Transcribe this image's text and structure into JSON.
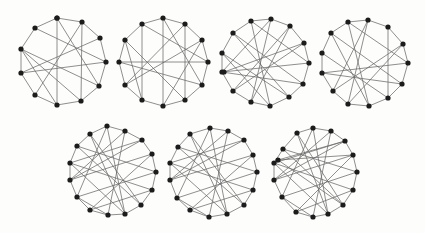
{
  "figure": {
    "graph_color": "#1c1c1c",
    "edge_color": "#6a6a6a",
    "graphs": [
      {
        "id": "g1",
        "nodes": [
          [
            57,
            18
          ],
          [
            82,
            22
          ],
          [
            35,
            28
          ],
          [
            100,
            38
          ],
          [
            21,
            49
          ],
          [
            106,
            62
          ],
          [
            21,
            73
          ],
          [
            99,
            86
          ],
          [
            35,
            95
          ],
          [
            57,
            105
          ],
          [
            81,
            101
          ],
          [
            57,
            18
          ]
        ],
        "edges": [
          [
            0,
            1
          ],
          [
            0,
            2
          ],
          [
            1,
            3
          ],
          [
            3,
            5
          ],
          [
            5,
            7
          ],
          [
            7,
            10
          ],
          [
            10,
            9
          ],
          [
            9,
            8
          ],
          [
            8,
            6
          ],
          [
            6,
            4
          ],
          [
            4,
            2
          ],
          [
            0,
            9
          ],
          [
            2,
            5
          ],
          [
            4,
            7
          ],
          [
            4,
            10
          ],
          [
            6,
            5
          ],
          [
            1,
            8
          ],
          [
            3,
            6
          ],
          [
            0,
            7
          ],
          [
            4,
            9
          ],
          [
            1,
            10
          ]
        ]
      },
      {
        "id": "g2",
        "nodes": [
          [
            163,
            18
          ],
          [
            142,
            24
          ],
          [
            185,
            24
          ],
          [
            125,
            40
          ],
          [
            202,
            40
          ],
          [
            119,
            62
          ],
          [
            208,
            62
          ],
          [
            125,
            85
          ],
          [
            202,
            85
          ],
          [
            142,
            100
          ],
          [
            185,
            100
          ],
          [
            163,
            106
          ]
        ],
        "edges": [
          [
            0,
            1
          ],
          [
            0,
            2
          ],
          [
            1,
            3
          ],
          [
            2,
            4
          ],
          [
            3,
            5
          ],
          [
            4,
            6
          ],
          [
            5,
            7
          ],
          [
            6,
            8
          ],
          [
            7,
            9
          ],
          [
            8,
            10
          ],
          [
            9,
            11
          ],
          [
            10,
            11
          ],
          [
            0,
            11
          ],
          [
            1,
            9
          ],
          [
            2,
            10
          ],
          [
            1,
            6
          ],
          [
            3,
            10
          ],
          [
            5,
            8
          ],
          [
            2,
            7
          ],
          [
            4,
            11
          ],
          [
            3,
            9
          ],
          [
            5,
            6
          ],
          [
            0,
            8
          ],
          [
            7,
            4
          ]
        ]
      },
      {
        "id": "g3",
        "nodes": [
          [
            251,
            21
          ],
          [
            271,
            19
          ],
          [
            290,
            26
          ],
          [
            233,
            33
          ],
          [
            304,
            43
          ],
          [
            222,
            53
          ],
          [
            309,
            63
          ],
          [
            222,
            72
          ],
          [
            303,
            84
          ],
          [
            233,
            91
          ],
          [
            289,
            97
          ],
          [
            251,
            102
          ],
          [
            270,
            106
          ],
          [
            224,
            72
          ]
        ],
        "edges": [
          [
            0,
            1
          ],
          [
            1,
            2
          ],
          [
            0,
            3
          ],
          [
            2,
            4
          ],
          [
            3,
            5
          ],
          [
            4,
            6
          ],
          [
            5,
            7
          ],
          [
            6,
            8
          ],
          [
            7,
            9
          ],
          [
            8,
            10
          ],
          [
            9,
            11
          ],
          [
            10,
            12
          ],
          [
            11,
            12
          ],
          [
            0,
            6
          ],
          [
            1,
            11
          ],
          [
            2,
            9
          ],
          [
            3,
            8
          ],
          [
            5,
            10
          ],
          [
            7,
            6
          ],
          [
            7,
            8
          ],
          [
            4,
            9
          ],
          [
            0,
            12
          ],
          [
            1,
            7
          ],
          [
            2,
            11
          ],
          [
            3,
            10
          ],
          [
            5,
            12
          ],
          [
            4,
            13
          ]
        ]
      },
      {
        "id": "g4",
        "nodes": [
          [
            348,
            22
          ],
          [
            368,
            20
          ],
          [
            388,
            27
          ],
          [
            331,
            33
          ],
          [
            403,
            44
          ],
          [
            322,
            53
          ],
          [
            408,
            63
          ],
          [
            322,
            73
          ],
          [
            402,
            84
          ],
          [
            333,
            91
          ],
          [
            388,
            98
          ],
          [
            369,
            106
          ],
          [
            348,
            104
          ]
        ],
        "edges": [
          [
            0,
            1
          ],
          [
            1,
            2
          ],
          [
            0,
            3
          ],
          [
            2,
            4
          ],
          [
            3,
            5
          ],
          [
            4,
            6
          ],
          [
            5,
            7
          ],
          [
            6,
            8
          ],
          [
            7,
            9
          ],
          [
            8,
            10
          ],
          [
            9,
            12
          ],
          [
            10,
            11
          ],
          [
            11,
            12
          ],
          [
            0,
            11
          ],
          [
            2,
            10
          ],
          [
            1,
            9
          ],
          [
            3,
            8
          ],
          [
            5,
            10
          ],
          [
            7,
            6
          ],
          [
            7,
            8
          ],
          [
            4,
            9
          ],
          [
            0,
            6
          ],
          [
            1,
            12
          ],
          [
            4,
            12
          ],
          [
            3,
            11
          ]
        ]
      },
      {
        "id": "g5",
        "nodes": [
          [
            107,
            126
          ],
          [
            125,
            131
          ],
          [
            90,
            134
          ],
          [
            142,
            140
          ],
          [
            77,
            146
          ],
          [
            152,
            154
          ],
          [
            70,
            163
          ],
          [
            156,
            172
          ],
          [
            70,
            180
          ],
          [
            152,
            190
          ],
          [
            77,
            197
          ],
          [
            141,
            205
          ],
          [
            90,
            210
          ],
          [
            125,
            214
          ],
          [
            108,
            215
          ]
        ],
        "edges": [
          [
            0,
            1
          ],
          [
            0,
            2
          ],
          [
            1,
            3
          ],
          [
            2,
            4
          ],
          [
            3,
            5
          ],
          [
            4,
            6
          ],
          [
            5,
            7
          ],
          [
            6,
            8
          ],
          [
            7,
            9
          ],
          [
            8,
            10
          ],
          [
            9,
            11
          ],
          [
            10,
            12
          ],
          [
            11,
            13
          ],
          [
            12,
            14
          ],
          [
            13,
            14
          ],
          [
            0,
            10
          ],
          [
            1,
            8
          ],
          [
            2,
            13
          ],
          [
            3,
            6
          ],
          [
            4,
            11
          ],
          [
            5,
            12
          ],
          [
            6,
            9
          ],
          [
            7,
            10
          ],
          [
            8,
            5
          ],
          [
            9,
            12
          ],
          [
            1,
            14
          ],
          [
            2,
            11
          ],
          [
            3,
            8
          ],
          [
            0,
            13
          ],
          [
            4,
            7
          ],
          [
            6,
            13
          ],
          [
            10,
            14
          ]
        ]
      },
      {
        "id": "g6",
        "nodes": [
          [
            210,
            128
          ],
          [
            228,
            131
          ],
          [
            190,
            134
          ],
          [
            244,
            140
          ],
          [
            178,
            147
          ],
          [
            253,
            155
          ],
          [
            170,
            163
          ],
          [
            257,
            172
          ],
          [
            170,
            180
          ],
          [
            253,
            190
          ],
          [
            177,
            198
          ],
          [
            244,
            205
          ],
          [
            190,
            210
          ],
          [
            227,
            214
          ],
          [
            209,
            217
          ]
        ],
        "edges": [
          [
            0,
            1
          ],
          [
            0,
            2
          ],
          [
            1,
            3
          ],
          [
            2,
            4
          ],
          [
            3,
            5
          ],
          [
            4,
            6
          ],
          [
            5,
            7
          ],
          [
            6,
            8
          ],
          [
            7,
            9
          ],
          [
            8,
            10
          ],
          [
            9,
            11
          ],
          [
            10,
            12
          ],
          [
            11,
            13
          ],
          [
            12,
            14
          ],
          [
            13,
            14
          ],
          [
            0,
            10
          ],
          [
            1,
            8
          ],
          [
            2,
            13
          ],
          [
            3,
            6
          ],
          [
            4,
            11
          ],
          [
            5,
            12
          ],
          [
            6,
            9
          ],
          [
            7,
            10
          ],
          [
            8,
            5
          ],
          [
            9,
            12
          ],
          [
            1,
            14
          ],
          [
            2,
            11
          ],
          [
            3,
            8
          ],
          [
            0,
            13
          ],
          [
            4,
            7
          ],
          [
            6,
            13
          ],
          [
            10,
            14
          ]
        ]
      },
      {
        "id": "g7",
        "nodes": [
          [
            313,
            128
          ],
          [
            331,
            131
          ],
          [
            297,
            133
          ],
          [
            345,
            141
          ],
          [
            283,
            149
          ],
          [
            353,
            155
          ],
          [
            274,
            163
          ],
          [
            357,
            172
          ],
          [
            274,
            180
          ],
          [
            353,
            190
          ],
          [
            282,
            197
          ],
          [
            343,
            205
          ],
          [
            296,
            212
          ],
          [
            328,
            214
          ],
          [
            313,
            217
          ],
          [
            278,
            160
          ]
        ],
        "edges": [
          [
            0,
            1
          ],
          [
            0,
            2
          ],
          [
            1,
            3
          ],
          [
            2,
            4
          ],
          [
            3,
            5
          ],
          [
            4,
            6
          ],
          [
            5,
            7
          ],
          [
            6,
            8
          ],
          [
            7,
            9
          ],
          [
            8,
            10
          ],
          [
            9,
            11
          ],
          [
            10,
            12
          ],
          [
            11,
            13
          ],
          [
            12,
            14
          ],
          [
            13,
            14
          ],
          [
            0,
            10
          ],
          [
            1,
            8
          ],
          [
            2,
            13
          ],
          [
            3,
            6
          ],
          [
            4,
            11
          ],
          [
            5,
            12
          ],
          [
            6,
            9
          ],
          [
            7,
            10
          ],
          [
            8,
            5
          ],
          [
            9,
            12
          ],
          [
            1,
            14
          ],
          [
            2,
            11
          ],
          [
            3,
            8
          ],
          [
            0,
            13
          ],
          [
            4,
            7
          ],
          [
            6,
            13
          ],
          [
            10,
            14
          ],
          [
            15,
            5
          ],
          [
            15,
            11
          ],
          [
            15,
            3
          ]
        ]
      }
    ]
  }
}
